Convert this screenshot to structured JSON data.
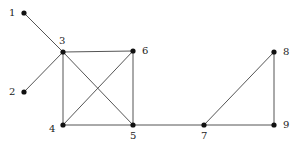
{
  "diagram": {
    "type": "undirected-graph",
    "nodes": [
      {
        "id": "1",
        "label": "1",
        "x": 24,
        "y": 13,
        "lx": 9,
        "ly": 16
      },
      {
        "id": "2",
        "label": "2",
        "x": 24,
        "y": 92,
        "lx": 9,
        "ly": 95
      },
      {
        "id": "3",
        "label": "3",
        "x": 63,
        "y": 52,
        "lx": 59,
        "ly": 44
      },
      {
        "id": "4",
        "label": "4",
        "x": 63,
        "y": 125,
        "lx": 49,
        "ly": 132
      },
      {
        "id": "5",
        "label": "5",
        "x": 133,
        "y": 125,
        "lx": 130,
        "ly": 139
      },
      {
        "id": "6",
        "label": "6",
        "x": 133,
        "y": 51,
        "lx": 142,
        "ly": 54
      },
      {
        "id": "7",
        "label": "7",
        "x": 204,
        "y": 125,
        "lx": 201,
        "ly": 139
      },
      {
        "id": "8",
        "label": "8",
        "x": 274,
        "y": 52,
        "lx": 283,
        "ly": 55
      },
      {
        "id": "9",
        "label": "9",
        "x": 274,
        "y": 125,
        "lx": 283,
        "ly": 128
      }
    ],
    "edges": [
      [
        "1",
        "3"
      ],
      [
        "2",
        "3"
      ],
      [
        "3",
        "6"
      ],
      [
        "3",
        "4"
      ],
      [
        "3",
        "5"
      ],
      [
        "6",
        "4"
      ],
      [
        "6",
        "5"
      ],
      [
        "4",
        "5"
      ],
      [
        "5",
        "7"
      ],
      [
        "7",
        "8"
      ],
      [
        "8",
        "9"
      ],
      [
        "7",
        "9"
      ]
    ],
    "colors": {
      "edge": "#555555",
      "node": "#111111",
      "label": "#222222"
    }
  }
}
